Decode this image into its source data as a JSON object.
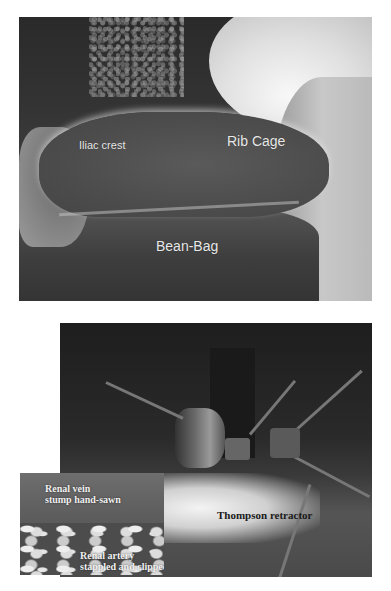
{
  "figure": {
    "top_photo": {
      "description": "Patient positioned laterally on bean-bag",
      "labels": {
        "iliac_crest": "Iliac crest",
        "rib_cage": "Rib Cage",
        "bean_bag": "Bean-Bag"
      }
    },
    "bottom_photo": {
      "description": "Surgical field with retractor",
      "labels": {
        "retractor": "Thompson retractor"
      },
      "inset": {
        "vein_label_line1": "Renal vein",
        "vein_label_line2": "stump hand-sawn",
        "artery_label_line1": "Renal artery",
        "artery_label_line2": "stappled and clipped"
      }
    }
  }
}
